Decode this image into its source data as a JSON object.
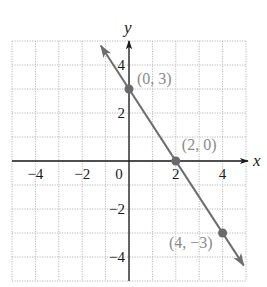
{
  "chart_data": {
    "type": "line",
    "title": "",
    "xlabel": "x",
    "ylabel": "y",
    "xlim": [
      -5,
      5
    ],
    "ylim": [
      -5,
      5
    ],
    "grid": true,
    "x_ticks": [
      -4,
      -2,
      0,
      2,
      4
    ],
    "y_ticks": [
      4,
      2,
      -2,
      -4
    ],
    "x_tick_labels": [
      "−4",
      "−2",
      "0",
      "2",
      "4"
    ],
    "y_tick_labels": [
      "4",
      "2",
      "−2",
      "−4"
    ],
    "series": [
      {
        "name": "line",
        "equation": "y = -3/2 x + 3",
        "slope": -1.5,
        "intercept": 3,
        "x": [
          -1.2,
          4.9
        ],
        "y": [
          4.8,
          -4.35
        ],
        "arrows": "both"
      }
    ],
    "points": [
      {
        "x": 0,
        "y": 3,
        "label": "(0, 3)"
      },
      {
        "x": 2,
        "y": 0,
        "label": "(2, 0)"
      },
      {
        "x": 4,
        "y": -3,
        "label": "(4, −3)"
      }
    ]
  },
  "colors": {
    "grid": "#b8b8b8",
    "axis": "#1a1a1a",
    "line": "#6e6e6e",
    "point": "#6a6a6a",
    "point_label": "#8a8a8a",
    "tick_label": "#1a1a1a"
  }
}
